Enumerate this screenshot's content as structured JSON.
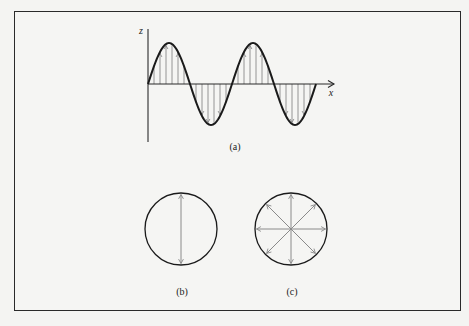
{
  "figure": {
    "frame": {
      "x": 14,
      "y": 11,
      "width": 447,
      "height": 300
    },
    "colors": {
      "curve": "#1a1a1a",
      "axis": "#2a2a2a",
      "arrow": "#8a8a8a",
      "background": "#f5f5f3",
      "frame": "#2a2a2a"
    },
    "panel_a": {
      "caption": "(a)",
      "caption_pos": [
        235,
        146
      ],
      "z_label": "z",
      "z_label_pos": [
        141,
        30
      ],
      "x_label": "x",
      "x_label_pos": [
        331,
        92
      ],
      "origin": [
        148,
        84
      ],
      "z_axis_top": 29,
      "z_axis_bottom": 142,
      "x_axis_end": 334,
      "wave": {
        "amplitude": 41,
        "wavelength": 84,
        "cycles": 2
      },
      "arrow_spacing": 6.5,
      "description": "Transverse wave along x with vertical arrows showing displacement in z"
    },
    "panel_b": {
      "caption": "(b)",
      "caption_pos": [
        182,
        291
      ],
      "circle": {
        "cx": 181,
        "cy": 229,
        "r": 36
      },
      "arrow_angles_deg": [
        90,
        270
      ],
      "description": "Linear polarization: double-headed vertical arrow across circle"
    },
    "panel_c": {
      "caption": "(c)",
      "caption_pos": [
        292,
        291
      ],
      "circle": {
        "cx": 291,
        "cy": 229,
        "r": 36
      },
      "arrow_angles_deg": [
        0,
        45,
        90,
        135,
        180,
        225,
        270,
        315
      ],
      "description": "Unpolarized light: arrows radiating in all directions"
    }
  }
}
